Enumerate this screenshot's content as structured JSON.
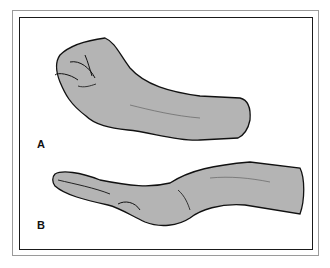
{
  "figure": {
    "panels": [
      {
        "label": "A",
        "description": "clenched fist, hand in flexion"
      },
      {
        "label": "B",
        "description": "flat hand with thumb tucked under palm"
      }
    ],
    "colors": {
      "skin": "#b4b4b4",
      "outline": "#111111",
      "frame_outer": "#9a9a9a",
      "frame_inner": "#1a1a1a"
    }
  }
}
